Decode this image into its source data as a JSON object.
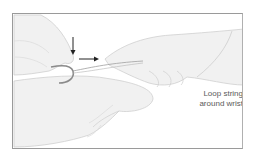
{
  "figure": {
    "caption_lines": [
      "Loop string",
      "around wrist"
    ],
    "elements": [
      {
        "name": "left-hand",
        "description": "hand holding fishhook at upper left"
      },
      {
        "name": "fishhook",
        "description": "curved fishhook with string looped through bend"
      },
      {
        "name": "right-hand",
        "description": "hand pulling string toward right"
      },
      {
        "name": "patient-hand",
        "description": "hand/palm lying beneath at bottom"
      },
      {
        "name": "down-arrow",
        "description": "arrow pointing down, press on hook shank"
      },
      {
        "name": "right-arrow",
        "description": "arrow pointing right, direction of pull"
      }
    ],
    "colors": {
      "skin_fill": "#f1f1f1",
      "outline": "#c4c4c4",
      "hook": "#8a8a8a",
      "arrow": "#222222",
      "frame": "#9a9a9a",
      "caption": "#5a5a5a"
    }
  }
}
